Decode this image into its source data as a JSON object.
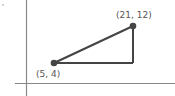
{
  "diagram": {
    "type": "coordinate-plane-right-triangle",
    "points": [
      {
        "label": "(5, 4)",
        "x": 5,
        "y": 4
      },
      {
        "label": "(21, 12)",
        "x": 21,
        "y": 12
      }
    ],
    "colors": {
      "axis": "#888888",
      "line": "#444444",
      "point": "#444444",
      "label": "#555555"
    }
  }
}
